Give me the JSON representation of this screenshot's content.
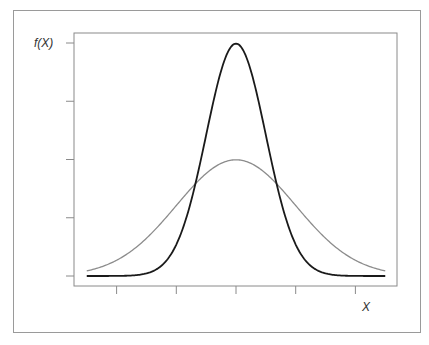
{
  "chart_data": {
    "type": "line",
    "title": "",
    "xlabel": "X",
    "ylabel": "f(X)",
    "x_ticks": [
      -2,
      -1,
      0,
      1,
      2
    ],
    "x_tick_labels": [],
    "y_ticks": [
      0,
      0.2,
      0.4,
      0.6,
      0.8
    ],
    "y_tick_labels": [],
    "xlim": [
      -2.5,
      2.7
    ],
    "ylim": [
      0,
      0.85
    ],
    "grid": false,
    "legend": null,
    "series": [
      {
        "name": "Normal density, sigma = 0.5 (narrow)",
        "color": "#1a1a1a",
        "mean": 0,
        "sd": 0.5,
        "x": [
          -2.5,
          -2,
          -1.5,
          -1,
          -0.75,
          -0.5,
          -0.25,
          0,
          0.25,
          0.5,
          0.75,
          1,
          1.5,
          2,
          2.5
        ],
        "values": [
          0.0,
          0.0003,
          0.0089,
          0.108,
          0.259,
          0.484,
          0.704,
          0.798,
          0.704,
          0.484,
          0.259,
          0.108,
          0.0089,
          0.0003,
          0.0
        ]
      },
      {
        "name": "Normal density, sigma = 1 (wide)",
        "color": "#8c8c8c",
        "mean": 0,
        "sd": 1,
        "x": [
          -2.5,
          -2,
          -1.5,
          -1,
          -0.5,
          0,
          0.5,
          1,
          1.5,
          2,
          2.5
        ],
        "values": [
          0.0175,
          0.054,
          0.1295,
          0.242,
          0.352,
          0.399,
          0.352,
          0.242,
          0.1295,
          0.054,
          0.0175
        ]
      }
    ]
  },
  "labels": {
    "y_axis": "f(X)",
    "x_axis": "X"
  }
}
